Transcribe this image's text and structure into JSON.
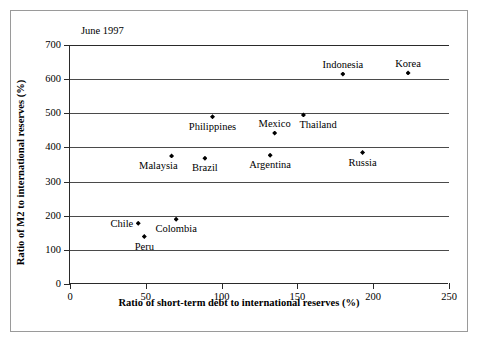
{
  "chart_data": {
    "type": "scatter",
    "title": "",
    "annotation": "June 1997",
    "xlabel": "Ratio of short-term debt to international reserves (%)",
    "ylabel": "Ratio of M2 to international reserves (%)",
    "xlim": [
      0,
      250
    ],
    "ylim": [
      0,
      700
    ],
    "xticks": [
      0,
      50,
      100,
      150,
      200,
      250
    ],
    "yticks": [
      0,
      100,
      200,
      300,
      400,
      500,
      600,
      700
    ],
    "xtick_labels": [
      "0",
      "50",
      "100",
      "150",
      "200",
      "250"
    ],
    "ytick_labels": [
      "0",
      "100",
      "200",
      "300",
      "400",
      "500",
      "600",
      "700"
    ],
    "grid": "horizontal",
    "legend": "none",
    "marker": "diamond",
    "marker_color": "#000000",
    "points": [
      {
        "name": "Korea",
        "x": 223,
        "y": 618,
        "label_pos": "above"
      },
      {
        "name": "Indonesia",
        "x": 180,
        "y": 615,
        "label_pos": "above"
      },
      {
        "name": "Thailand",
        "x": 154,
        "y": 495,
        "label_pos": "below-right"
      },
      {
        "name": "Philippines",
        "x": 94,
        "y": 490,
        "label_pos": "below"
      },
      {
        "name": "Mexico",
        "x": 135,
        "y": 442,
        "label_pos": "above"
      },
      {
        "name": "Russia",
        "x": 193,
        "y": 385,
        "label_pos": "below"
      },
      {
        "name": "Argentina",
        "x": 132,
        "y": 377,
        "label_pos": "below"
      },
      {
        "name": "Malaysia",
        "x": 67,
        "y": 375,
        "label_pos": "below-left"
      },
      {
        "name": "Brazil",
        "x": 89,
        "y": 368,
        "label_pos": "below"
      },
      {
        "name": "Colombia",
        "x": 70,
        "y": 190,
        "label_pos": "below"
      },
      {
        "name": "Chile",
        "x": 45,
        "y": 178,
        "label_pos": "left"
      },
      {
        "name": "Peru",
        "x": 49,
        "y": 139,
        "label_pos": "below"
      }
    ]
  }
}
